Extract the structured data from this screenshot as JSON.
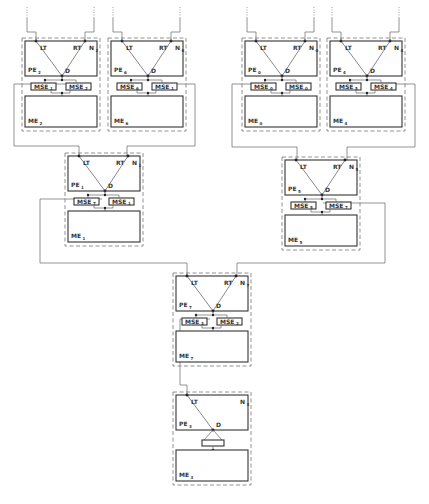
{
  "diagram": {
    "kind": "binary tree of processing/memory elements",
    "labels": {
      "left_terminal": "LT",
      "right_terminal": "RT",
      "decision": "D",
      "pe_prefix": "PE",
      "me_prefix": "ME",
      "mse_prefix": "MSE",
      "node_prefix": "N"
    },
    "modules": [
      {
        "id": "N2",
        "index": "2",
        "x": 22,
        "y": 38,
        "level": 0,
        "has_rt": true,
        "mse": [
          "1",
          "2"
        ],
        "input_top": true
      },
      {
        "id": "N6",
        "index": "6",
        "x": 108,
        "y": 38,
        "level": 0,
        "has_rt": true,
        "mse": [
          "6",
          "1"
        ],
        "input_top": true
      },
      {
        "id": "N0",
        "index": "0",
        "x": 242,
        "y": 38,
        "level": 0,
        "has_rt": true,
        "mse": [
          "0",
          "0"
        ],
        "input_top": true
      },
      {
        "id": "N4",
        "index": "4",
        "x": 327,
        "y": 38,
        "level": 0,
        "has_rt": true,
        "mse": [
          "5",
          "4"
        ],
        "input_top": true
      },
      {
        "id": "N1",
        "index": "1",
        "x": 65,
        "y": 153,
        "level": 1,
        "has_rt": true,
        "mse": [
          "7",
          "1"
        ],
        "input_top": false
      },
      {
        "id": "N5",
        "index": "5",
        "x": 282,
        "y": 157,
        "level": 1,
        "has_rt": true,
        "mse": [
          "5",
          "7"
        ],
        "input_top": false
      },
      {
        "id": "N7",
        "index": "7",
        "x": 173,
        "y": 273,
        "level": 2,
        "has_rt": true,
        "mse": [
          "3",
          "2"
        ],
        "input_top": false
      },
      {
        "id": "N3",
        "index": "3",
        "x": 173,
        "y": 392,
        "level": 3,
        "has_rt": false,
        "mse": [
          "",
          ""
        ],
        "input_top": false
      }
    ],
    "connections": [
      {
        "from": "N2",
        "to": "N1",
        "side": "LT",
        "path": [
          [
            71,
            84
          ],
          [
            14,
            84
          ],
          [
            14,
            146
          ],
          [
            79,
            146
          ],
          [
            79,
            157
          ]
        ]
      },
      {
        "from": "N6",
        "to": "N1",
        "side": "RT",
        "path": [
          [
            171,
            84
          ],
          [
            195,
            84
          ],
          [
            195,
            146
          ],
          [
            127,
            146
          ],
          [
            127,
            157
          ]
        ]
      },
      {
        "from": "N0",
        "to": "N5",
        "side": "LT",
        "path": [
          [
            263,
            84
          ],
          [
            232,
            84
          ],
          [
            232,
            147
          ],
          [
            297,
            147
          ],
          [
            297,
            161
          ]
        ]
      },
      {
        "from": "N4",
        "to": "N5",
        "side": "RT",
        "path": [
          [
            388,
            84
          ],
          [
            415,
            84
          ],
          [
            415,
            147
          ],
          [
            347,
            147
          ],
          [
            347,
            161
          ]
        ]
      },
      {
        "from": "N1",
        "to": "N7",
        "side": "LT",
        "path": [
          [
            102,
            199
          ],
          [
            40,
            199
          ],
          [
            40,
            263
          ],
          [
            187,
            263
          ],
          [
            187,
            277
          ]
        ]
      },
      {
        "from": "N5",
        "to": "N7",
        "side": "RT",
        "path": [
          [
            323,
            203
          ],
          [
            385,
            203
          ],
          [
            385,
            263
          ],
          [
            237,
            263
          ],
          [
            237,
            277
          ]
        ]
      },
      {
        "from": "N7",
        "to": "N3",
        "side": "LT",
        "path": [
          [
            210,
            319
          ],
          [
            180,
            319
          ],
          [
            180,
            385
          ],
          [
            187,
            385
          ],
          [
            187,
            396
          ]
        ]
      }
    ]
  }
}
